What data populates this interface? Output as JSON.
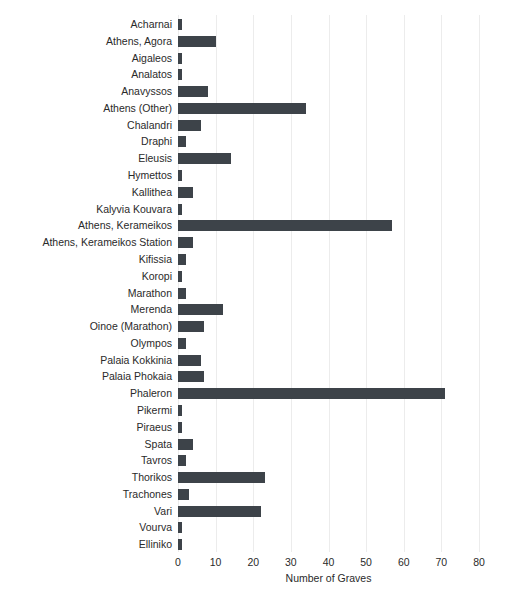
{
  "chart": {
    "background": "#ffffff",
    "bar_color": "#3d4349",
    "grid_color": "#ececec",
    "text_color": "#2a2a2a"
  },
  "chart_data": {
    "type": "bar",
    "orientation": "horizontal",
    "title": "",
    "xlabel": "Number of Graves",
    "ylabel": "",
    "xlim": [
      0,
      80
    ],
    "xticks": [
      0,
      10,
      20,
      30,
      40,
      50,
      60,
      70,
      80
    ],
    "grid": "vertical",
    "legend": "none",
    "categories": [
      "Acharnai",
      "Athens, Agora",
      "Aigaleos",
      "Analatos",
      "Anavyssos",
      "Athens (Other)",
      "Chalandri",
      "Draphi",
      "Eleusis",
      "Hymettos",
      "Kallithea",
      "Kalyvia Kouvara",
      "Athens, Kerameikos",
      "Athens, Kerameikos Station",
      "Kifissia",
      "Koropi",
      "Marathon",
      "Merenda",
      "Oinoe (Marathon)",
      "Olympos",
      "Palaia Kokkinia",
      "Palaia Phokaia",
      "Phaleron",
      "Pikermi",
      "Piraeus",
      "Spata",
      "Tavros",
      "Thorikos",
      "Trachones",
      "Vari",
      "Vourva",
      "Elliniko"
    ],
    "values": [
      1,
      10,
      1,
      1,
      8,
      34,
      6,
      2,
      14,
      1,
      4,
      1,
      57,
      4,
      2,
      1,
      2,
      12,
      7,
      2,
      6,
      7,
      71,
      1,
      1,
      4,
      2,
      23,
      3,
      22,
      1,
      1
    ]
  }
}
